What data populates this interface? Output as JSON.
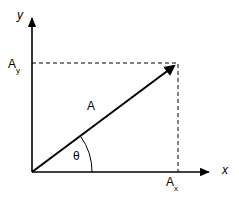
{
  "figure": {
    "background_color": "#ffffff",
    "stroke_color": "#000000",
    "axes": {
      "x_label": "x",
      "y_label": "y",
      "origin": {
        "x": 32,
        "y": 172
      },
      "x_axis_end": {
        "x": 214,
        "y": 172
      },
      "y_axis_end": {
        "x": 32,
        "y": 14
      }
    },
    "labels": {
      "vector": "A",
      "x_component_base": "A",
      "x_component_sub": "x",
      "y_component_base": "A",
      "y_component_sub": "y",
      "angle": "θ"
    },
    "vector": {
      "start": {
        "x": 32,
        "y": 172
      },
      "tip": {
        "x": 178,
        "y": 63
      },
      "arrow_style": "solid-filled"
    },
    "projection_lines": {
      "style": "dashed",
      "horizontal": {
        "x1": 32,
        "y1": 63,
        "x2": 178,
        "y2": 63
      },
      "vertical": {
        "x1": 178,
        "y1": 63,
        "x2": 178,
        "y2": 172
      }
    },
    "angle_arc": {
      "radius": 60,
      "from_axis": "x-axis",
      "to": "vector"
    }
  }
}
